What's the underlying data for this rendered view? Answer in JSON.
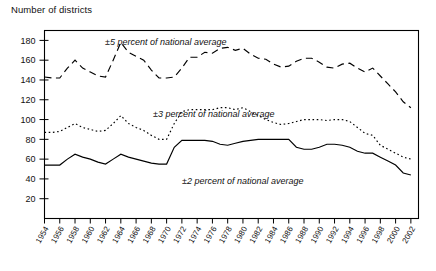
{
  "figure": {
    "y_axis_title": "Number of districts"
  },
  "chart_data": {
    "type": "line",
    "title": "Number of districts",
    "xlabel": "",
    "ylabel": "Number of districts",
    "ylim": [
      0,
      190
    ],
    "xlim": [
      1954,
      2003
    ],
    "grid": false,
    "legend_position": "inline-annotations",
    "y_ticks": [
      20,
      40,
      60,
      80,
      100,
      120,
      140,
      160,
      180
    ],
    "x_ticks": [
      1954,
      1956,
      1958,
      1960,
      1962,
      1964,
      1966,
      1968,
      1970,
      1972,
      1974,
      1976,
      1978,
      1980,
      1982,
      1984,
      1986,
      1988,
      1990,
      1992,
      1994,
      1996,
      1998,
      2000,
      2002
    ],
    "x": [
      1954,
      1955,
      1956,
      1957,
      1958,
      1959,
      1960,
      1961,
      1962,
      1963,
      1964,
      1965,
      1966,
      1967,
      1968,
      1969,
      1970,
      1971,
      1972,
      1973,
      1974,
      1975,
      1976,
      1977,
      1978,
      1979,
      1980,
      1981,
      1982,
      1983,
      1984,
      1985,
      1986,
      1987,
      1988,
      1989,
      1990,
      1991,
      1992,
      1993,
      1994,
      1995,
      1996,
      1997,
      1998,
      1999,
      2000,
      2001,
      2002
    ],
    "series": [
      {
        "name": "±5 percent of national average",
        "style": "dashed",
        "annotation": "±5 percent of national average",
        "values": [
          143,
          142,
          142,
          152,
          160,
          152,
          148,
          144,
          143,
          160,
          178,
          168,
          164,
          160,
          150,
          142,
          142,
          143,
          152,
          163,
          163,
          168,
          167,
          172,
          173,
          170,
          172,
          166,
          162,
          161,
          156,
          153,
          154,
          159,
          162,
          162,
          158,
          153,
          152,
          156,
          157,
          152,
          148,
          152,
          144,
          136,
          128,
          118,
          112
        ]
      },
      {
        "name": "±3 percent of national average",
        "style": "dotted",
        "annotation": "±3 percent of national average",
        "values": [
          87,
          87,
          88,
          92,
          96,
          92,
          90,
          88,
          89,
          96,
          104,
          96,
          92,
          89,
          84,
          80,
          80,
          96,
          108,
          110,
          110,
          110,
          110,
          112,
          112,
          110,
          112,
          108,
          104,
          100,
          97,
          95,
          96,
          98,
          100,
          100,
          100,
          99,
          100,
          100,
          98,
          92,
          86,
          84,
          74,
          70,
          66,
          62,
          60
        ]
      },
      {
        "name": "±2 percent of national average",
        "style": "solid",
        "annotation": "±2 percent of national average",
        "values": [
          54,
          54,
          54,
          60,
          65,
          62,
          60,
          57,
          55,
          60,
          65,
          62,
          60,
          58,
          56,
          55,
          55,
          72,
          79,
          79,
          79,
          79,
          78,
          75,
          74,
          76,
          78,
          79,
          80,
          80,
          80,
          80,
          80,
          72,
          70,
          70,
          72,
          75,
          75,
          74,
          72,
          68,
          66,
          66,
          62,
          58,
          54,
          46,
          44
        ]
      }
    ],
    "annotations": [
      {
        "text": "±5 percent of national average",
        "x_px": 105,
        "y_px": 45
      },
      {
        "text": "±3 percent of national average",
        "x_px": 153,
        "y_px": 117
      },
      {
        "text": "±2 percent of national average",
        "x_px": 182,
        "y_px": 184
      }
    ]
  }
}
